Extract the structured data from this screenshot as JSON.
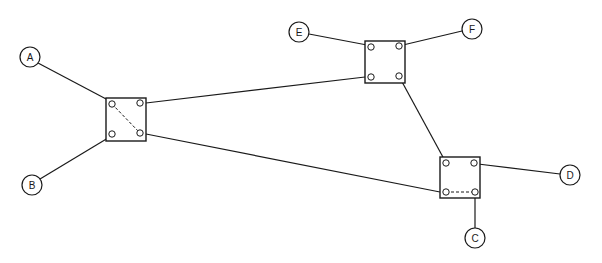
{
  "diagram": {
    "type": "network-topology",
    "colors": {
      "stroke": "#1a1a1a",
      "background": "#ffffff"
    },
    "terminals": [
      {
        "id": "A",
        "label": "A",
        "cx": 30,
        "cy": 57,
        "r": 10
      },
      {
        "id": "B",
        "label": "B",
        "cx": 32,
        "cy": 185,
        "r": 10
      },
      {
        "id": "C",
        "label": "C",
        "cx": 475,
        "cy": 238,
        "r": 10
      },
      {
        "id": "D",
        "label": "D",
        "cx": 570,
        "cy": 175,
        "r": 10
      },
      {
        "id": "E",
        "label": "E",
        "cx": 299,
        "cy": 32,
        "r": 10
      },
      {
        "id": "F",
        "label": "F",
        "cx": 472,
        "cy": 29,
        "r": 10
      }
    ],
    "switches": [
      {
        "id": "S1",
        "x": 106,
        "y": 98,
        "w": 40,
        "h": 43,
        "ports": {
          "tl": [
            112,
            104
          ],
          "tr": [
            140,
            103
          ],
          "bl": [
            112,
            134
          ],
          "br": [
            140,
            133
          ]
        },
        "internal": [
          {
            "from": "tl",
            "to": "br",
            "style": "dashed"
          }
        ]
      },
      {
        "id": "S2",
        "x": 365,
        "y": 41,
        "w": 40,
        "h": 42,
        "ports": {
          "tl": [
            371,
            47
          ],
          "tr": [
            399,
            46
          ],
          "bl": [
            371,
            77
          ],
          "br": [
            399,
            76
          ]
        },
        "internal": []
      },
      {
        "id": "S3",
        "x": 440,
        "y": 157,
        "w": 40,
        "h": 41,
        "ports": {
          "tl": [
            446,
            163
          ],
          "tr": [
            474,
            163
          ],
          "bl": [
            446,
            192
          ],
          "br": [
            475,
            192
          ]
        },
        "internal": [
          {
            "from": "bl",
            "to": "br",
            "style": "dashed"
          }
        ]
      }
    ],
    "links": [
      {
        "id": "A-S1",
        "from": "A",
        "to": "S1.tl",
        "x1": 38,
        "y1": 63,
        "x2": 108,
        "y2": 100
      },
      {
        "id": "B-S1",
        "from": "B",
        "to": "S1.bl",
        "x1": 40,
        "y1": 179,
        "x2": 108,
        "y2": 138
      },
      {
        "id": "S1-S2",
        "from": "S1.tr",
        "to": "S2.bl",
        "x1": 146,
        "y1": 103,
        "x2": 365,
        "y2": 77
      },
      {
        "id": "S1-S3",
        "from": "S1.br",
        "to": "S3.bl",
        "x1": 146,
        "y1": 134,
        "x2": 440,
        "y2": 192
      },
      {
        "id": "E-S2",
        "from": "E",
        "to": "S2.tl",
        "x1": 309,
        "y1": 34,
        "x2": 367,
        "y2": 45
      },
      {
        "id": "F-S2",
        "from": "F",
        "to": "S2.tr",
        "x1": 462,
        "y1": 31,
        "x2": 403,
        "y2": 45
      },
      {
        "id": "S2-S3",
        "from": "S2.br",
        "to": "S3.tl",
        "x1": 401,
        "y1": 80,
        "x2": 444,
        "y2": 159
      },
      {
        "id": "S3-D",
        "from": "S3.tr",
        "to": "D",
        "x1": 478,
        "y1": 164,
        "x2": 560,
        "y2": 174
      },
      {
        "id": "S3-C",
        "from": "S3.br",
        "to": "C",
        "x1": 475,
        "y1": 196,
        "x2": 475,
        "y2": 228
      }
    ]
  }
}
